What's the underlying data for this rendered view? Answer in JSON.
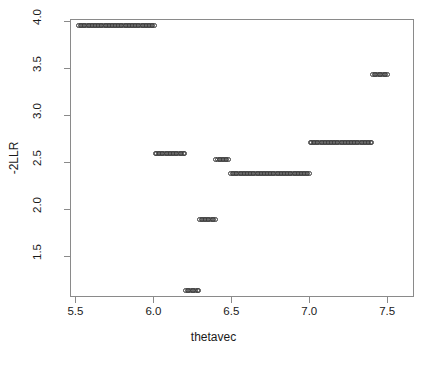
{
  "chart_data": {
    "type": "scatter",
    "title": "",
    "xlabel": "thetavec",
    "ylabel": "-2LLR",
    "xlim": [
      5.465,
      7.672
    ],
    "ylim": [
      1.06,
      4.02
    ],
    "xticks": [
      "5.5",
      "6.0",
      "6.5",
      "7.0",
      "7.5"
    ],
    "xtick_values": [
      5.5,
      6.0,
      6.5,
      7.0,
      7.5
    ],
    "yticks": [
      "1.5",
      "2.0",
      "2.5",
      "3.0",
      "3.5",
      "4.0"
    ],
    "ytick_values": [
      1.5,
      2.0,
      2.5,
      3.0,
      3.5,
      4.0
    ],
    "grid": false,
    "legend": null,
    "marker": "open-circle",
    "marker_color": "#3a3a3a",
    "box_color": "#8a8a8a",
    "background": "#ffffff",
    "series": [
      {
        "name": "-2LLR",
        "description": "Step-function profile: -2 log likelihood ratio evaluated over a grid of thetavec values, forming 8 flat plateaus.",
        "segments": [
          {
            "y": 3.96,
            "x_start": 5.515,
            "x_end": 6.0,
            "n_points": 50
          },
          {
            "y": 2.6,
            "x_start": 6.005,
            "x_end": 6.195,
            "n_points": 20
          },
          {
            "y": 1.14,
            "x_start": 6.2,
            "x_end": 6.285,
            "n_points": 9
          },
          {
            "y": 1.9,
            "x_start": 6.29,
            "x_end": 6.39,
            "n_points": 11
          },
          {
            "y": 2.53,
            "x_start": 6.395,
            "x_end": 6.475,
            "n_points": 9
          },
          {
            "y": 2.39,
            "x_start": 6.49,
            "x_end": 6.995,
            "n_points": 52
          },
          {
            "y": 2.72,
            "x_start": 7.0,
            "x_end": 7.395,
            "n_points": 41
          },
          {
            "y": 3.44,
            "x_start": 7.4,
            "x_end": 7.495,
            "n_points": 10
          }
        ]
      }
    ]
  },
  "plot": {
    "title_text": ""
  }
}
